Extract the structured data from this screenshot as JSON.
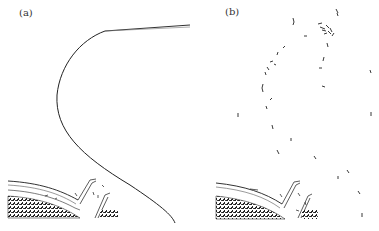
{
  "figure": {
    "panels": [
      {
        "id": "a",
        "label": "(a)",
        "description": "Continuous curved line trajectory descending from upper right to lower right, above a textured surface structure"
      },
      {
        "id": "b",
        "label": "(b)",
        "description": "Scattered short line fragments along a similar curved path above the same textured surface structure"
      }
    ]
  }
}
